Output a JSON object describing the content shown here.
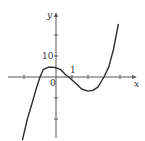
{
  "chart_data": {
    "type": "line",
    "title": "",
    "xlabel": "x",
    "ylabel": "y",
    "origin_label": "0",
    "x_tick_label": {
      "value": 1,
      "text": "1"
    },
    "y_tick_label": {
      "value": 10,
      "text": "10"
    },
    "x_ticks": [
      -2,
      1,
      2,
      4
    ],
    "y_ticks": [
      20,
      10,
      -10,
      -20
    ],
    "xlim": [
      -3,
      5
    ],
    "ylim": [
      -30,
      31
    ],
    "grid": false,
    "legend": null,
    "series": [
      {
        "name": "f(x)",
        "description": "cubic with roots near -1, 0.8, 3; local max near (-0.25, 4.5), local min near (2, -7)",
        "x": [
          -2.1,
          -1.8,
          -1.5,
          -1.2,
          -1.0,
          -0.8,
          -0.5,
          -0.25,
          0.0,
          0.3,
          0.6,
          0.8,
          1.0,
          1.3,
          1.6,
          2.0,
          2.3,
          2.6,
          3.0,
          3.3,
          3.6,
          3.9
        ],
        "y": [
          -30.1,
          -20.3,
          -12.6,
          -4.7,
          0.0,
          3.5,
          4.6,
          4.7,
          4.4,
          3.5,
          1.1,
          0.0,
          -1.4,
          -3.5,
          -5.7,
          -6.7,
          -6.4,
          -4.9,
          0.0,
          4.8,
          13.4,
          25.3
        ]
      }
    ]
  },
  "colors": {
    "curve": "#2a2a2a",
    "axis": "#555555",
    "background": "#ffffff"
  },
  "layout": {
    "origin_px": [
      56,
      77
    ],
    "px_per_x_unit": 16,
    "px_per_y_unit": 2.1,
    "x_axis_px": [
      8,
      137
    ],
    "y_axis_px": [
      12,
      138
    ]
  }
}
